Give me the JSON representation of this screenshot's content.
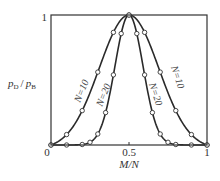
{
  "chart_data": {
    "type": "line",
    "title": "",
    "xlabel": "M/N",
    "ylabel": "pD / pB",
    "ylabel_parts": {
      "p1": "p",
      "s1": "D",
      "slash": "/",
      "p2": "p",
      "s2": "B"
    },
    "xlim": [
      0,
      1
    ],
    "ylim": [
      0,
      1
    ],
    "grid": false,
    "legend": "inline curve labels",
    "x_ticks": [
      "0",
      "0.5",
      "1"
    ],
    "y_ticks": [
      "0",
      "1"
    ],
    "series": [
      {
        "name": "N=10",
        "sigma": 0.19,
        "markers": [
          {
            "x": 0.0,
            "y": 0.0
          },
          {
            "x": 0.1,
            "y": 0.09
          },
          {
            "x": 0.2,
            "y": 0.28
          },
          {
            "x": 0.3,
            "y": 0.58
          },
          {
            "x": 0.4,
            "y": 0.85
          },
          {
            "x": 0.5,
            "y": 1.0
          },
          {
            "x": 0.6,
            "y": 0.85
          },
          {
            "x": 0.7,
            "y": 0.58
          },
          {
            "x": 0.8,
            "y": 0.28
          },
          {
            "x": 0.9,
            "y": 0.09
          },
          {
            "x": 1.0,
            "y": 0.0
          }
        ]
      },
      {
        "name": "N=20",
        "sigma": 0.09,
        "markers": [
          {
            "x": 0.0,
            "y": 0.0
          },
          {
            "x": 0.1,
            "y": 0.005
          },
          {
            "x": 0.2,
            "y": 0.03
          },
          {
            "x": 0.25,
            "y": 0.09
          },
          {
            "x": 0.3,
            "y": 0.19
          },
          {
            "x": 0.35,
            "y": 0.38
          },
          {
            "x": 0.4,
            "y": 0.6
          },
          {
            "x": 0.45,
            "y": 0.9
          },
          {
            "x": 0.5,
            "y": 1.0
          },
          {
            "x": 0.55,
            "y": 0.9
          },
          {
            "x": 0.6,
            "y": 0.6
          },
          {
            "x": 0.65,
            "y": 0.38
          },
          {
            "x": 0.7,
            "y": 0.19
          },
          {
            "x": 0.75,
            "y": 0.09
          },
          {
            "x": 0.8,
            "y": 0.03
          },
          {
            "x": 0.9,
            "y": 0.005
          },
          {
            "x": 1.0,
            "y": 0.0
          }
        ]
      }
    ],
    "annotations": [
      "N=10",
      "N=20",
      "N=20",
      "N=10"
    ]
  }
}
